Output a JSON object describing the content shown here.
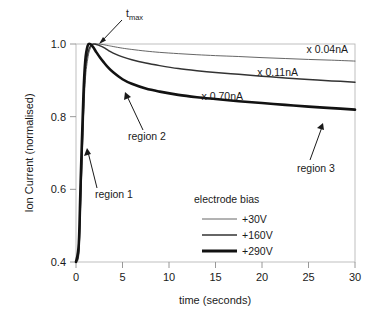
{
  "chart_data": {
    "type": "line",
    "title": "",
    "xlabel": "time (seconds)",
    "ylabel": "Ion Current (normalised)",
    "xlim": [
      0,
      30
    ],
    "ylim": [
      0.4,
      1.0
    ],
    "xticks": [
      "0",
      "5",
      "10",
      "15",
      "20",
      "25",
      "30"
    ],
    "yticks": [
      "0.4",
      "0.6",
      "0.8",
      "1.0"
    ],
    "grid": false,
    "legend_position": "inside-lower-center",
    "series": [
      {
        "name": "+30V",
        "label": "x 0.04nA",
        "stroke_width": 0.9,
        "color": "#555555",
        "x": [
          0.0,
          0.3,
          0.5,
          0.8,
          1.0,
          1.3,
          1.6,
          1.9,
          2.2,
          2.6,
          3.0,
          3.5,
          4.0,
          5.0,
          6.0,
          7.5,
          9.0,
          11.0,
          13.0,
          15.0,
          17.5,
          20.0,
          22.5,
          25.0,
          27.5,
          30.0
        ],
        "y": [
          0.4,
          0.42,
          0.55,
          0.78,
          0.9,
          0.965,
          0.991,
          0.999,
          1.0,
          0.9995,
          0.998,
          0.9955,
          0.993,
          0.9885,
          0.985,
          0.9805,
          0.977,
          0.9735,
          0.9705,
          0.968,
          0.9655,
          0.9625,
          0.96,
          0.9575,
          0.9555,
          0.953
        ]
      },
      {
        "name": "+160V",
        "label": "x 0.11nA",
        "stroke_width": 1.5,
        "color": "#333333",
        "x": [
          0.0,
          0.3,
          0.5,
          0.8,
          1.0,
          1.3,
          1.6,
          1.9,
          2.2,
          2.6,
          3.0,
          3.5,
          4.0,
          5.0,
          6.0,
          7.5,
          9.0,
          11.0,
          13.0,
          15.0,
          17.5,
          20.0,
          22.5,
          25.0,
          27.5,
          30.0
        ],
        "y": [
          0.4,
          0.43,
          0.58,
          0.82,
          0.93,
          0.978,
          0.996,
          1.0,
          0.9985,
          0.995,
          0.99,
          0.982,
          0.975,
          0.9645,
          0.9565,
          0.9475,
          0.9405,
          0.9325,
          0.9265,
          0.9215,
          0.9165,
          0.9115,
          0.9065,
          0.9025,
          0.8985,
          0.895
        ]
      },
      {
        "name": "+290V",
        "label": "x 0.70nA",
        "stroke_width": 2.6,
        "color": "#121212",
        "x": [
          0.0,
          0.3,
          0.5,
          0.8,
          1.0,
          1.25,
          1.5,
          1.8,
          2.2,
          2.6,
          3.0,
          3.5,
          4.0,
          5.0,
          6.0,
          7.5,
          9.0,
          11.0,
          13.0,
          15.0,
          17.5,
          20.0,
          22.5,
          25.0,
          27.5,
          30.0
        ],
        "y": [
          0.4,
          0.45,
          0.62,
          0.86,
          0.955,
          0.995,
          1.0,
          0.993,
          0.977,
          0.962,
          0.949,
          0.934,
          0.922,
          0.903,
          0.8905,
          0.8775,
          0.869,
          0.86,
          0.8535,
          0.8485,
          0.8425,
          0.8375,
          0.8325,
          0.8275,
          0.8235,
          0.8195
        ]
      }
    ],
    "annotations": [
      {
        "name": "t-max",
        "text": "t",
        "subscript": "max"
      },
      {
        "name": "region-1",
        "text": "region 1"
      },
      {
        "name": "region-2",
        "text": "region 2"
      },
      {
        "name": "region-3",
        "text": "region 3"
      }
    ],
    "legend": {
      "title": "electrode bias",
      "entries": [
        "+30V",
        "+160V",
        "+290V"
      ]
    }
  }
}
